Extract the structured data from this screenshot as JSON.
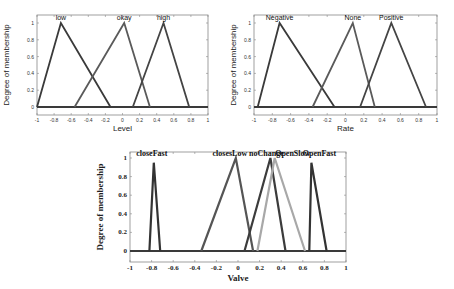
{
  "chart_data": [
    {
      "type": "line",
      "title": "",
      "xlabel": "Level",
      "ylabel": "Degree of membership",
      "xlim": [
        -1,
        1
      ],
      "ylim": [
        -0.1,
        1.1
      ],
      "xticks": [
        "-1",
        "-0.8",
        "-0.6",
        "-0.4",
        "-0.2",
        "0",
        "0.2",
        "0.4",
        "0.6",
        "0.8",
        "1"
      ],
      "yticks": [
        "0",
        "0.2",
        "0.4",
        "0.6",
        "0.8",
        "1"
      ],
      "grid": false,
      "series": [
        {
          "name": "low",
          "points": [
            [
              -1,
              0
            ],
            [
              -0.72,
              1
            ],
            [
              -0.14,
              0
            ]
          ],
          "color": "#3a3a3a"
        },
        {
          "name": "okay",
          "points": [
            [
              -0.56,
              0
            ],
            [
              0.02,
              1
            ],
            [
              0.32,
              0
            ]
          ],
          "color": "#5a5a5a"
        },
        {
          "name": "high",
          "points": [
            [
              0.12,
              0
            ],
            [
              0.48,
              1
            ],
            [
              0.78,
              0
            ]
          ],
          "color": "#444444"
        }
      ]
    },
    {
      "type": "line",
      "title": "",
      "xlabel": "Rate",
      "ylabel": "Degree of membership",
      "xlim": [
        -1,
        1
      ],
      "ylim": [
        -0.1,
        1.1
      ],
      "xticks": [
        "-1",
        "-0.8",
        "-0.6",
        "-0.4",
        "-0.2",
        "0",
        "0.2",
        "0.4",
        "0.6",
        "0.8",
        "1"
      ],
      "yticks": [
        "0",
        "0.2",
        "0.4",
        "0.6",
        "0.8",
        "1"
      ],
      "grid": false,
      "series": [
        {
          "name": "Negative",
          "points": [
            [
              -0.96,
              0
            ],
            [
              -0.72,
              1
            ],
            [
              -0.12,
              0
            ]
          ],
          "color": "#3a3a3a"
        },
        {
          "name": "None",
          "points": [
            [
              -0.36,
              0
            ],
            [
              0.08,
              1
            ],
            [
              0.32,
              0
            ]
          ],
          "color": "#5a5a5a"
        },
        {
          "name": "Positive",
          "points": [
            [
              0.16,
              0
            ],
            [
              0.5,
              1
            ],
            [
              0.88,
              0
            ]
          ],
          "color": "#444444"
        }
      ]
    },
    {
      "type": "line",
      "title": "",
      "xlabel": "Valve",
      "ylabel": "Degree of membership",
      "xlim": [
        -1,
        1
      ],
      "ylim": [
        -0.1,
        1.1
      ],
      "xticks": [
        "-1",
        "-0.8",
        "-0.6",
        "-0.4",
        "-0.2",
        "0",
        "0.2",
        "0.4",
        "0.6",
        "0.8",
        "1"
      ],
      "yticks": [
        "0",
        "0.2",
        "0.4",
        "0.6",
        "0.8",
        "1"
      ],
      "grid": false,
      "series": [
        {
          "name": "closeFast",
          "points": [
            [
              -0.82,
              0
            ],
            [
              -0.78,
              0.95
            ],
            [
              -0.72,
              0
            ]
          ],
          "color": "#333333"
        },
        {
          "name": "closesLow",
          "points": [
            [
              -0.34,
              0
            ],
            [
              -0.02,
              1
            ],
            [
              0.14,
              0
            ]
          ],
          "color": "#555555"
        },
        {
          "name": "noChange",
          "points": [
            [
              0.06,
              0
            ],
            [
              0.3,
              1
            ],
            [
              0.44,
              0
            ]
          ],
          "color": "#3c3c3c"
        },
        {
          "name": "OpenSlow",
          "points": [
            [
              0.18,
              0
            ],
            [
              0.34,
              1
            ],
            [
              0.62,
              0
            ]
          ],
          "color": "#a8a8a8"
        },
        {
          "name": "OpenFast",
          "points": [
            [
              0.66,
              0
            ],
            [
              0.68,
              0.95
            ],
            [
              0.82,
              0
            ]
          ],
          "color": "#333333"
        }
      ]
    }
  ]
}
